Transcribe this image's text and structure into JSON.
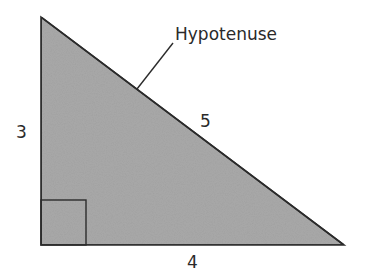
{
  "diagram": {
    "type": "right-triangle",
    "colors": {
      "fill": "#a9a9a9",
      "stroke": "#2b2b2b",
      "text": "#2a2a2a",
      "background": "#ffffff"
    },
    "vertices": {
      "top": [
        41,
        17
      ],
      "bottom_left": [
        41,
        245
      ],
      "bottom_right": [
        344,
        245
      ]
    },
    "right_angle_marker": {
      "x": 41,
      "y": 200,
      "size": 45
    },
    "sides": {
      "vertical": {
        "label": "3"
      },
      "horizontal": {
        "label": "4"
      },
      "hypotenuse": {
        "label": "5"
      }
    },
    "callout": {
      "text": "Hypotenuse",
      "leader_from": [
        173,
        43
      ],
      "leader_to": [
        137,
        89
      ]
    }
  }
}
